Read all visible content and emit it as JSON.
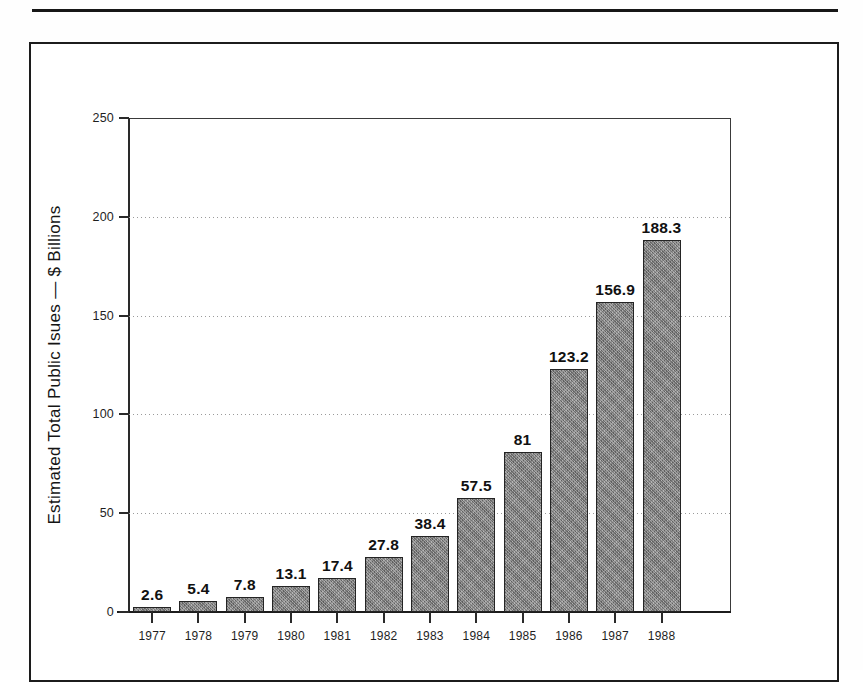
{
  "figure": {
    "frame_border_color": "#1c1c1c",
    "rule_color": "#171717"
  },
  "chart_data": {
    "type": "bar",
    "title": "",
    "xlabel": "",
    "ylabel": "Estimated Total Public Isues — $ Billions",
    "categories": [
      "1977",
      "1978",
      "1979",
      "1980",
      "1981",
      "1982",
      "1983",
      "1984",
      "1985",
      "1986",
      "1987",
      "1988"
    ],
    "values": [
      2.6,
      5.4,
      7.8,
      13.1,
      17.4,
      27.8,
      38.4,
      57.5,
      81,
      123.2,
      156.9,
      188.3
    ],
    "value_labels": [
      "2.6",
      "5.4",
      "7.8",
      "13.1",
      "17.4",
      "27.8",
      "38.4",
      "57.5",
      "81",
      "123.2",
      "156.9",
      "188.3"
    ],
    "ylim": [
      0,
      250
    ],
    "yticks": [
      0,
      50,
      100,
      150,
      200,
      250
    ],
    "ytick_labels": [
      "0",
      "50",
      "100",
      "150",
      "200",
      "250"
    ],
    "gridlines": [
      50,
      100,
      150,
      200
    ],
    "grid": true,
    "grid_style": "dotted",
    "legend": null,
    "bar_color": "#878787",
    "bar_edge_color": "#242424",
    "axis_color": "#2a2a2a",
    "background": "#ffffff"
  }
}
